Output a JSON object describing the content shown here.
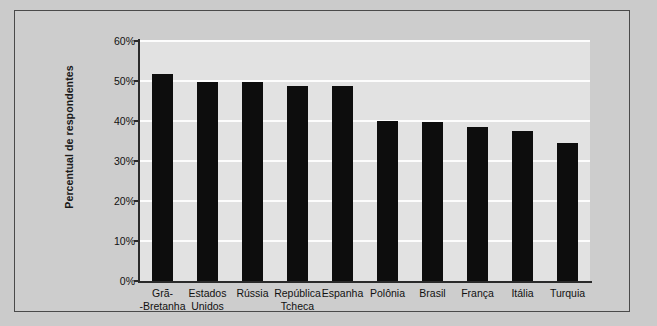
{
  "chart_data": {
    "type": "bar",
    "title": "",
    "xlabel": "",
    "ylabel": "Percentual de respondentes",
    "ylim": [
      0,
      60
    ],
    "ytick_labels": [
      "60%",
      "50%",
      "40%",
      "30%",
      "20%",
      "10%",
      "0%"
    ],
    "ytick_values": [
      60,
      50,
      40,
      30,
      20,
      10,
      0
    ],
    "grid": true,
    "legend": false,
    "bar_color": "#0d0d0d",
    "plot_background": "#e2e2e2",
    "gridline_color": "#fdfdfd",
    "figure_background": "#cdcdcd",
    "categories": [
      "Grã-\n-Bretanha",
      "Estados\nUnidos",
      "Rússia",
      "República\nTcheca",
      "Espanha",
      "Polônia",
      "Brasil",
      "França",
      "Itália",
      "Turquia"
    ],
    "category_lines": [
      [
        "Grã-",
        "-Bretanha"
      ],
      [
        "Estados",
        "Unidos"
      ],
      [
        "Rússia",
        ""
      ],
      [
        "República",
        "Tcheca"
      ],
      [
        "Espanha",
        ""
      ],
      [
        "Polônia",
        ""
      ],
      [
        "Brasil",
        ""
      ],
      [
        "França",
        ""
      ],
      [
        "Itália",
        ""
      ],
      [
        "Turquia",
        ""
      ]
    ],
    "values": [
      51.7,
      49.8,
      49.7,
      48.8,
      48.8,
      39.9,
      39.7,
      38.4,
      37.4,
      34.4
    ]
  }
}
